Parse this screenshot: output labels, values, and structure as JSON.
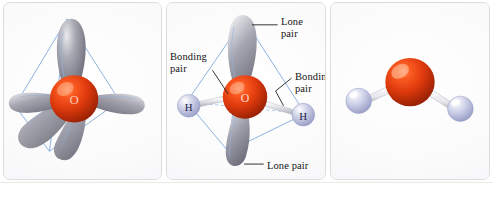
{
  "figure": {
    "background_color": "#ffffff",
    "panel_border_color": "#dcdcdc"
  },
  "colors": {
    "oxygen": "#d9340d",
    "oxygen_highlight": "#ff8a55",
    "oxygen_shadow": "#8e1c04",
    "hydrogen": "#c6c9e4",
    "hydrogen_highlight": "#ffffff",
    "hydrogen_edge": "#8f95bd",
    "orbital_lobe": "#9a9aa6",
    "orbital_lobe_highlight": "#e4e4ea",
    "orbital_lobe_shadow": "#6d6d79",
    "tetrahedron_edge": "#6f9fd8",
    "tetrahedron_hidden_edge": "#8fb6e0",
    "bond_stick": "#e8e8ec",
    "bond_stick_edge": "#b6b6bf",
    "label_text": "#141414",
    "caption_box_fill": "#9d9674",
    "caption_box_text": "#ffffff",
    "caption_rule": "#cfcec4"
  },
  "panels": [
    {
      "id": "a",
      "caption_letter": "a",
      "description": "Four sp3 hybrid orbital lobes on a central oxygen atom arranged toward the corners of a tetrahedron",
      "center_atom": {
        "element": "O",
        "label": "O",
        "show_label": true
      },
      "lobes": 4,
      "tetrahedron": true,
      "hydrogens": [],
      "labels": []
    },
    {
      "id": "b",
      "caption_letter": "b",
      "description": "Water molecule with two bonding pairs to hydrogen atoms and two lone pairs, inside a tetrahedron",
      "center_atom": {
        "element": "O",
        "label": "O",
        "show_label": true
      },
      "lobes": 2,
      "tetrahedron": true,
      "hydrogens": [
        {
          "label": "H",
          "position": "left"
        },
        {
          "label": "H",
          "position": "right"
        }
      ],
      "labels": [
        {
          "id": "lone-pair-top",
          "line1": "Lone",
          "line2": "pair",
          "lines": 2
        },
        {
          "id": "bonding-pair-left",
          "line1": "Bonding",
          "line2": "pair",
          "lines": 2
        },
        {
          "id": "bonding-pair-right",
          "line1": "Bonding",
          "line2": "pair",
          "lines": 2
        },
        {
          "id": "lone-pair-bottom",
          "line1": "Lone pair",
          "line2": "",
          "lines": 1
        }
      ]
    },
    {
      "id": "c",
      "caption_letter": "c",
      "description": "Ball-and-stick model of water showing bent molecular geometry",
      "center_atom": {
        "element": "O",
        "label": "O",
        "show_label": false
      },
      "lobes": 0,
      "tetrahedron": false,
      "hydrogens": [
        {
          "label": "H",
          "position": "left"
        },
        {
          "label": "H",
          "position": "right"
        }
      ],
      "labels": []
    }
  ],
  "caption_labels": {
    "a": "a",
    "b": "b",
    "c": "c"
  },
  "label_text": {
    "lone_top_l1": "Lone",
    "lone_top_l2": "pair",
    "bonding_left_l1": "Bonding",
    "bonding_left_l2": "pair",
    "bonding_right_l1": "Bonding",
    "bonding_right_l2": "pair",
    "lone_bottom": "Lone pair",
    "atom_o": "O",
    "atom_h_left": "H",
    "atom_h_right": "H"
  }
}
